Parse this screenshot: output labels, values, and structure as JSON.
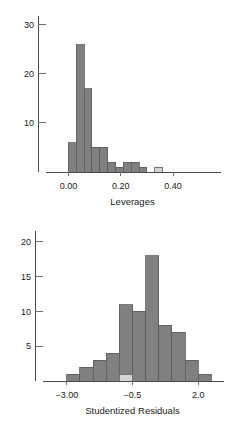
{
  "figure": {
    "background": "#ffffff",
    "bar_color": "#808080",
    "bar_highlight_color": "#d4d4d4",
    "bar_edge_color": "#5a5a5a",
    "axis_color": "#4a4a4a"
  },
  "chart_data": [
    {
      "type": "bar",
      "id": "leverages-histogram",
      "title": "",
      "xlabel": "Leverages",
      "ylabel": "",
      "grid": false,
      "legend": null,
      "xlim": [
        -0.04,
        0.53
      ],
      "ylim": [
        0,
        31
      ],
      "xticks": [
        0.0,
        0.2,
        0.4
      ],
      "xticklabels": [
        "0.00",
        "0.20",
        "0.40"
      ],
      "yticks": [
        10,
        20,
        30
      ],
      "yticklabels": [
        "10",
        "20",
        "30"
      ],
      "bin_width": 0.03,
      "bins": [
        {
          "x0": 0.0,
          "x1": 0.03,
          "value": 6,
          "highlight": false
        },
        {
          "x0": 0.03,
          "x1": 0.06,
          "value": 26,
          "highlight": false
        },
        {
          "x0": 0.06,
          "x1": 0.09,
          "value": 17,
          "highlight": false
        },
        {
          "x0": 0.09,
          "x1": 0.12,
          "value": 5,
          "highlight": false
        },
        {
          "x0": 0.12,
          "x1": 0.15,
          "value": 5,
          "highlight": false
        },
        {
          "x0": 0.15,
          "x1": 0.18,
          "value": 2,
          "highlight": false
        },
        {
          "x0": 0.18,
          "x1": 0.21,
          "value": 1,
          "highlight": false
        },
        {
          "x0": 0.21,
          "x1": 0.24,
          "value": 2,
          "highlight": false
        },
        {
          "x0": 0.24,
          "x1": 0.27,
          "value": 2,
          "highlight": false
        },
        {
          "x0": 0.27,
          "x1": 0.3,
          "value": 1,
          "highlight": false
        },
        {
          "x0": 0.3,
          "x1": 0.33,
          "value": 0,
          "highlight": false
        },
        {
          "x0": 0.33,
          "x1": 0.36,
          "value": 1,
          "highlight": true
        }
      ]
    },
    {
      "type": "bar",
      "id": "studentized-residuals-histogram",
      "title": "",
      "xlabel": "Studentized Residuals",
      "ylabel": "",
      "grid": false,
      "legend": null,
      "xlim": [
        -3.45,
        2.45
      ],
      "ylim": [
        0,
        21
      ],
      "xticks": [
        -3.0,
        -0.5,
        2.0
      ],
      "xticklabels": [
        "−3.00",
        "−0.5",
        "2.0"
      ],
      "yticks": [
        5,
        10,
        15,
        20
      ],
      "yticklabels": [
        "5",
        "10",
        "15",
        "20"
      ],
      "bin_width": 0.5,
      "bins": [
        {
          "x0": -3.0,
          "x1": -2.5,
          "value": 1,
          "highlight": false
        },
        {
          "x0": -2.5,
          "x1": -2.0,
          "value": 2,
          "highlight": false
        },
        {
          "x0": -2.0,
          "x1": -1.5,
          "value": 3,
          "highlight": false
        },
        {
          "x0": -1.5,
          "x1": -1.0,
          "value": 4,
          "highlight": false
        },
        {
          "x0": -1.0,
          "x1": -0.5,
          "value": 11,
          "highlight": false
        },
        {
          "x0": -0.5,
          "x1": 0.0,
          "value": 10,
          "highlight": false
        },
        {
          "x0": 0.0,
          "x1": 0.5,
          "value": 18,
          "highlight": false
        },
        {
          "x0": 0.5,
          "x1": 1.0,
          "value": 8,
          "highlight": false
        },
        {
          "x0": 1.0,
          "x1": 1.5,
          "value": 7,
          "highlight": false
        },
        {
          "x0": 1.5,
          "x1": 2.0,
          "value": 3,
          "highlight": false
        },
        {
          "x0": 2.0,
          "x1": 2.5,
          "value": 1,
          "highlight": false
        }
      ],
      "highlight_segment": {
        "x0": -1.0,
        "x1": -0.5,
        "value": 1,
        "note": "pale base segment"
      }
    }
  ]
}
